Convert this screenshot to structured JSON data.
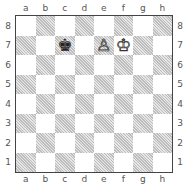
{
  "board": {
    "files": [
      "a",
      "b",
      "c",
      "d",
      "e",
      "f",
      "g",
      "h"
    ],
    "ranks": [
      "8",
      "7",
      "6",
      "5",
      "4",
      "3",
      "2",
      "1"
    ],
    "colors": {
      "light": "#ffffff",
      "dark": "#d0d0d0",
      "border": "#444444"
    },
    "pieces": [
      {
        "square": "c7",
        "piece": "king",
        "color": "black",
        "glyph": "♚"
      },
      {
        "square": "e7",
        "piece": "pawn",
        "color": "white",
        "glyph": "♙"
      },
      {
        "square": "f7",
        "piece": "king",
        "color": "white",
        "glyph": "♔"
      }
    ]
  }
}
